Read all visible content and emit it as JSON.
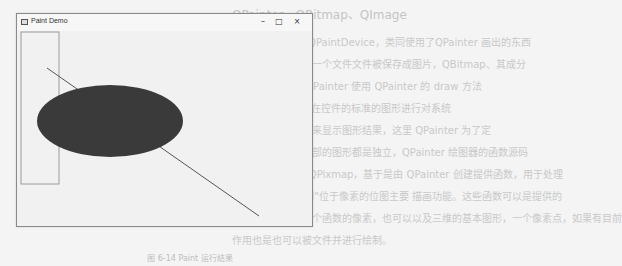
{
  "window": {
    "title": "Paint Demo",
    "controls": {
      "minimize": "–",
      "maximize": "□",
      "close": "×"
    }
  },
  "canvas": {
    "shapes": [
      {
        "type": "rectangle",
        "x": 4,
        "y": 1,
        "width": 38,
        "height": 152,
        "stroke": "#9a9a9a",
        "fill": "none"
      },
      {
        "type": "line",
        "x1": 30,
        "y1": 37,
        "x2": 242,
        "y2": 185,
        "stroke": "#555555"
      },
      {
        "type": "ellipse",
        "cx": 93,
        "cy": 90,
        "rx": 73,
        "ry": 36,
        "fill": "#3a3a3a"
      }
    ]
  },
  "background": {
    "lines": [
      "OPainter、QBitmap、QImage",
      "QPainter 被用于QPaintDevice，类同使用了QPainter 画出的东西",
      "都是一个文本对象一个文件文件被保存成图片，QBitmap、其成分",
      "文件，我通知可 OPainter 使用 QPainter 的 draw 方法",
      "显示 QPainter 是在控件的标准的图形进行对系统",
      "的绘图结合上方向来显示图形结果，这里 QPainter 为了定",
      "结果，所以，它内部的图形都是独立，QPainter 绘图器的函数源码",
      "QBitmap 是基于QPixmap，基于是由 QPainter 创建提供函数，用于处理",
      "QPixmap 上\"绘制\"位于像素的位图主要 描画功能。这些函数可以是提供的",
      "可以多次绘制的三个函数的像素，也可以以及三维的基本图形，一个像素点，如果有目前",
      "作用也是也可以被文件并进行绘制。"
    ]
  },
  "caption": "图 6-14  Paint 运行结果"
}
